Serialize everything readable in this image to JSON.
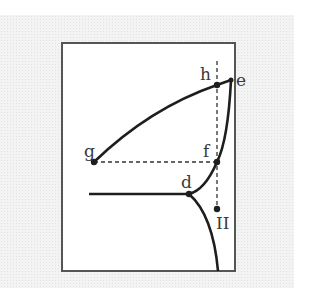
{
  "diagram": {
    "type": "phase-diagram",
    "colors": {
      "line": "#1e1e1e",
      "frame": "#555555",
      "label": "#3a3a3a",
      "background": "#f3f3f3"
    },
    "points": [
      {
        "id": "h",
        "label": "h",
        "x": 217,
        "y": 85
      },
      {
        "id": "e",
        "label": "e",
        "x": 231,
        "y": 80
      },
      {
        "id": "g",
        "label": "g",
        "x": 94,
        "y": 162
      },
      {
        "id": "f",
        "label": "f",
        "x": 217,
        "y": 162
      },
      {
        "id": "d",
        "label": "d",
        "x": 189,
        "y": 194
      },
      {
        "id": "II",
        "label": "II",
        "x": 217,
        "y": 209
      }
    ],
    "labels": {
      "h": "h",
      "e": "e",
      "g": "g",
      "f": "f",
      "d": "d",
      "II": "II"
    }
  }
}
